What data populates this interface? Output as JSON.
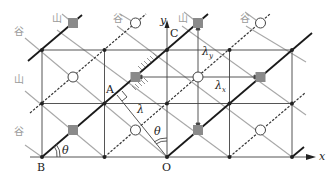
{
  "diagram": {
    "type": "crease-pattern-lattice",
    "axes": {
      "x_label": "x",
      "y_label": "y"
    },
    "points": {
      "origin": "O",
      "a": "A",
      "b": "B",
      "c": "C"
    },
    "symbols": {
      "lambda": "λ",
      "lambda_x": "λ",
      "lambda_x_sub": "x",
      "lambda_y": "λ",
      "lambda_y_sub": "y",
      "theta_left": "θ",
      "theta_right": "θ"
    },
    "fold_labels": {
      "top": [
        "山",
        "谷",
        "山",
        "谷"
      ],
      "left_top": "谷",
      "left_mid": "山",
      "left_bottom": "谷"
    },
    "legend_meaning": {
      "mountain": "山",
      "valley": "谷"
    },
    "colors": {
      "mountain_line": "#1a1a1a",
      "valley_line": "#333333",
      "grid_line": "#555555",
      "diagonal_gray": "#a8a8a8",
      "square_fill": "#8a8a8a",
      "label_gray": "#9a9a9a"
    }
  }
}
